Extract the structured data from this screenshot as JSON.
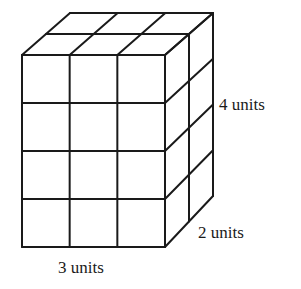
{
  "diagram": {
    "type": "rectangular-prism-of-unit-cubes",
    "line_color": "#1a1a1a",
    "background": "#ffffff",
    "dimensions": {
      "length": 3,
      "width": 2,
      "height": 4
    },
    "labels": {
      "height": "4 units",
      "width": "2 units",
      "length": "3 units"
    }
  }
}
